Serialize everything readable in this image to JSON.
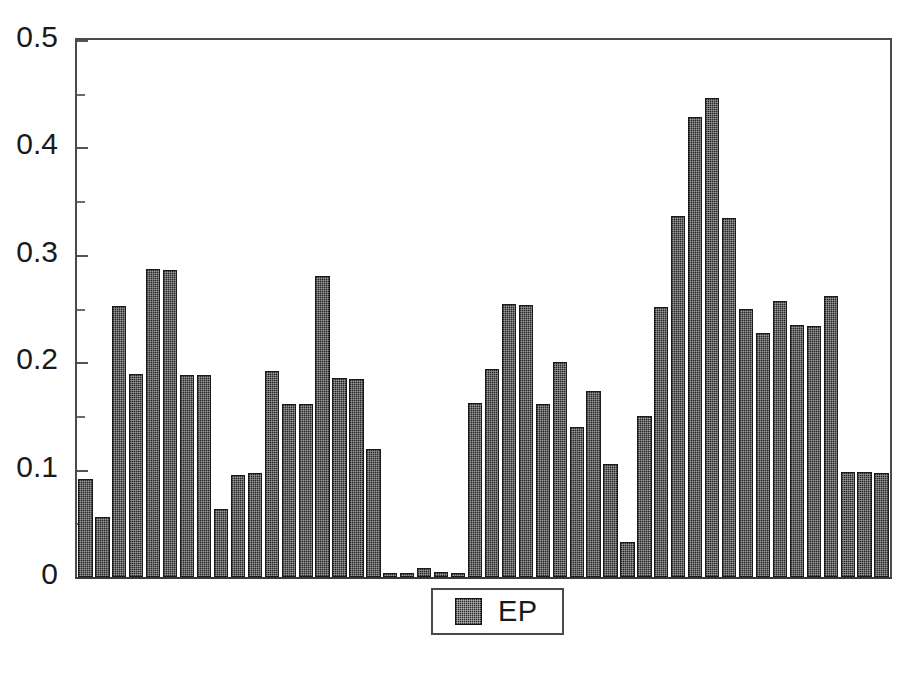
{
  "chart_data": {
    "type": "bar",
    "title": "",
    "subtitle": "",
    "xlabel": "",
    "ylabel": "",
    "ylim": [
      0,
      0.5
    ],
    "xlim": [
      0,
      41
    ],
    "grid": false,
    "legend_position": "bottom-center",
    "y_ticks_major": [
      0,
      0.1,
      0.2,
      0.3,
      0.4,
      0.5
    ],
    "y_tick_labels": [
      "0",
      "0.1",
      "0.2",
      "0.3",
      "0.4",
      "0.5"
    ],
    "y_ticks_minor": [
      0.05,
      0.15,
      0.25,
      0.35,
      0.45
    ],
    "x_tick_labels": [],
    "series": [
      {
        "name": "EP",
        "color": "#262626",
        "pattern": "fine-dotted",
        "values": [
          0.091,
          0.056,
          0.252,
          0.189,
          0.287,
          0.286,
          0.188,
          0.188,
          0.063,
          0.095,
          0.097,
          0.192,
          0.161,
          0.161,
          0.28,
          0.185,
          0.184,
          0.119,
          0.004,
          0.004,
          0.008,
          0.005,
          0.004,
          0.162,
          0.194,
          0.254,
          0.253,
          0.161,
          0.2,
          0.14,
          0.173,
          0.105,
          0.033,
          0.15,
          0.251,
          0.336,
          0.428,
          0.446,
          0.334,
          0.25,
          0.227,
          0.257,
          0.235,
          0.234,
          0.262,
          0.098,
          0.098,
          0.097
        ]
      }
    ],
    "legend": [
      {
        "label": "EP",
        "color": "#262626"
      }
    ]
  },
  "axes": {
    "y_labels": [
      {
        "text": "0.5",
        "value": 0.5
      },
      {
        "text": "0.4",
        "value": 0.4
      },
      {
        "text": "0.3",
        "value": 0.3
      },
      {
        "text": "0.2",
        "value": 0.2
      },
      {
        "text": "0.1",
        "value": 0.1
      },
      {
        "text": "0",
        "value": 0
      }
    ]
  },
  "legend": {
    "entry_label": "EP"
  },
  "colors": {
    "bar_fill": "#262626",
    "bar_stroke": "#1a1a1a",
    "axis_line": "#4a4a4a",
    "text": "#1a1a1a",
    "background": "#ffffff"
  }
}
